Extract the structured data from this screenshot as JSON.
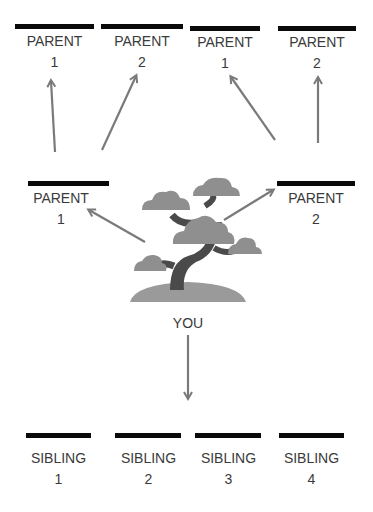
{
  "diagram": {
    "type": "family-tree",
    "center": {
      "label": "YOU"
    },
    "grandparents": [
      {
        "label": "PARENT",
        "number": "1"
      },
      {
        "label": "PARENT",
        "number": "2"
      },
      {
        "label": "PARENT",
        "number": "1"
      },
      {
        "label": "PARENT",
        "number": "2"
      }
    ],
    "parents": [
      {
        "label": "PARENT",
        "number": "1"
      },
      {
        "label": "PARENT",
        "number": "2"
      }
    ],
    "siblings": [
      {
        "label": "SIBLING",
        "number": "1"
      },
      {
        "label": "SIBLING",
        "number": "2"
      },
      {
        "label": "SIBLING",
        "number": "3"
      },
      {
        "label": "SIBLING",
        "number": "4"
      }
    ],
    "icons": {
      "center": "bonsai-tree-icon"
    },
    "colors": {
      "bar": "#0a0a0a",
      "arrow": "#7a7a7a",
      "foliage": "#8f8f8f",
      "trunk": "#4a4a4a",
      "ground": "#9a9a9a"
    }
  }
}
